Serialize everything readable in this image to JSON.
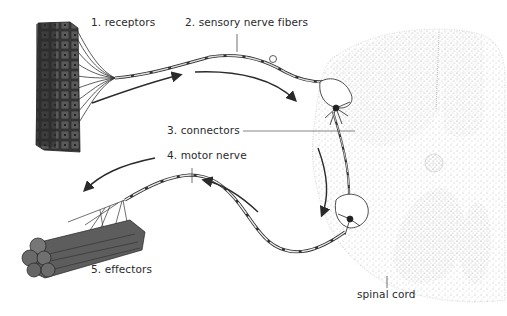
{
  "diagram": {
    "labels": {
      "receptors": "1. receptors",
      "sensory": "2. sensory nerve fibers",
      "connectors": "3. connectors",
      "motor": "4. motor nerve",
      "effectors": "5. effectors",
      "spinal_cord": "spinal cord"
    },
    "colors": {
      "ink": "#2a2a2a",
      "stipple": "#8a8a8a",
      "background": "#ffffff"
    }
  }
}
